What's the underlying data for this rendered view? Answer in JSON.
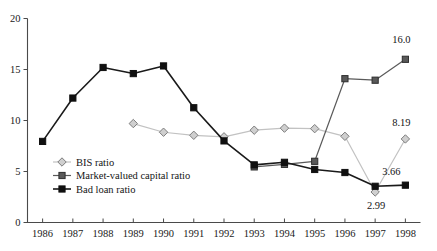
{
  "chart_data": {
    "type": "line",
    "title": "",
    "xlabel": "",
    "ylabel": "",
    "x": [
      "1986",
      "1987",
      "1988",
      "1989",
      "1990",
      "1991",
      "1992",
      "1993",
      "1994",
      "1995",
      "1996",
      "1997",
      "1998"
    ],
    "categories": [
      "1986",
      "1987",
      "1988",
      "1989",
      "1990",
      "1991",
      "1992",
      "1993",
      "1994",
      "1995",
      "1996",
      "1997",
      "1998"
    ],
    "xlim": [
      1985.5,
      1998.7
    ],
    "ylim": [
      0,
      20
    ],
    "yticks": [
      0,
      5,
      10,
      15,
      20
    ],
    "ytick_labels": [
      "0",
      "5",
      "10",
      "15",
      "20"
    ],
    "grid": false,
    "legend_position": "inside-lower-left",
    "series": [
      {
        "name": "BIS ratio",
        "marker": "diamond",
        "color": "#cfcfcf",
        "edge_color": "#7d7d7d",
        "line_color": "#c2c2c2",
        "values": [
          null,
          null,
          null,
          9.7,
          8.85,
          8.55,
          8.4,
          9.05,
          9.25,
          9.2,
          8.45,
          2.99,
          8.19
        ]
      },
      {
        "name": "Market-valued capital ratio",
        "marker": "square",
        "color": "#595959",
        "edge_color": "#2e2e2e",
        "line_color": "#5a5a5a",
        "values": [
          null,
          null,
          null,
          null,
          null,
          null,
          null,
          5.45,
          5.7,
          6.0,
          14.1,
          13.95,
          16.0
        ]
      },
      {
        "name": "Bad loan ratio",
        "marker": "square",
        "color": "#101010",
        "edge_color": "#101010",
        "line_color": "#1a1a1a",
        "values": [
          7.95,
          12.2,
          15.2,
          14.6,
          15.35,
          11.25,
          8.0,
          5.65,
          5.9,
          5.2,
          4.9,
          3.55,
          3.66
        ]
      }
    ],
    "annotations": [
      {
        "text": "16.0",
        "x": "1998",
        "value": 16.0,
        "dx": -4,
        "dy": -16,
        "series": "Market-valued capital ratio"
      },
      {
        "text": "8.19",
        "x": "1998",
        "value": 8.19,
        "dx": -4,
        "dy": -13,
        "series": "BIS ratio"
      },
      {
        "text": "3.66",
        "x": "1998",
        "value": 3.66,
        "dx": -14,
        "dy": -10,
        "series": "Bad loan ratio"
      },
      {
        "text": "2.99",
        "x": "1997",
        "value": 2.99,
        "dx": 1,
        "dy": 17,
        "series": "BIS ratio"
      }
    ],
    "legend_entries": [
      {
        "label": "BIS ratio",
        "marker": "diamond",
        "fill": "#cfcfcf",
        "stroke": "#7d7d7d",
        "line": "#c2c2c2"
      },
      {
        "label": "Market-valued capital ratio",
        "marker": "square",
        "fill": "#595959",
        "stroke": "#2e2e2e",
        "line": "#5a5a5a"
      },
      {
        "label": "Bad loan ratio",
        "marker": "square",
        "fill": "#101010",
        "stroke": "#101010",
        "line": "#1a1a1a"
      }
    ]
  }
}
